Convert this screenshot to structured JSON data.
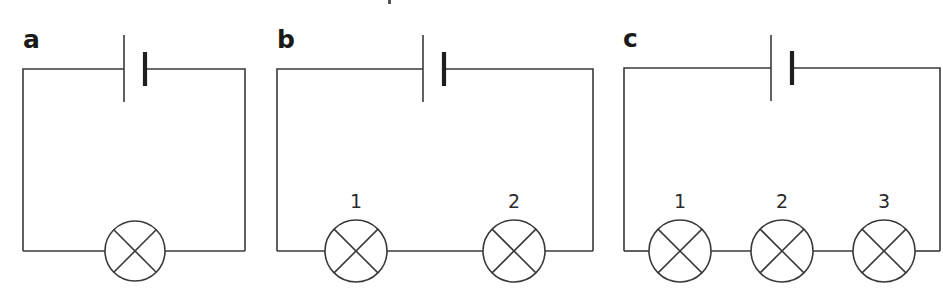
{
  "figure": {
    "colors": {
      "line": "#3a3a3a",
      "background": "#ffffff"
    }
  },
  "panels": [
    {
      "id": "a",
      "label": "a",
      "label_pos": [
        23,
        48
      ],
      "wire_box": {
        "left": 23,
        "right": 245,
        "top": 69,
        "bottom": 251
      },
      "battery": {
        "long_x": 124,
        "short_x": 145,
        "long_y": [
          35,
          102
        ],
        "short_y": [
          52,
          86
        ]
      },
      "lamps": [
        {
          "cx": 135,
          "cy": 251,
          "r": 30,
          "label": ""
        }
      ]
    },
    {
      "id": "b",
      "label": "b",
      "label_pos": [
        277,
        48
      ],
      "wire_box": {
        "left": 277,
        "right": 593,
        "top": 69,
        "bottom": 251
      },
      "battery": {
        "long_x": 423,
        "short_x": 444,
        "long_y": [
          35,
          102
        ],
        "short_y": [
          52,
          86
        ]
      },
      "lamps": [
        {
          "cx": 356,
          "cy": 251,
          "r": 31,
          "label": "1"
        },
        {
          "cx": 514,
          "cy": 251,
          "r": 31,
          "label": "2"
        }
      ]
    },
    {
      "id": "c",
      "label": "c",
      "label_pos": [
        623,
        47
      ],
      "wire_box": {
        "left": 624,
        "right": 940,
        "top": 68,
        "bottom": 251
      },
      "battery": {
        "long_x": 771,
        "short_x": 792,
        "long_y": [
          35,
          101
        ],
        "short_y": [
          51,
          85
        ]
      },
      "lamps": [
        {
          "cx": 680,
          "cy": 251,
          "r": 31,
          "label": "1"
        },
        {
          "cx": 782,
          "cy": 251,
          "r": 31,
          "label": "2"
        },
        {
          "cx": 884,
          "cy": 251,
          "r": 31,
          "label": "3"
        }
      ]
    }
  ],
  "lamp_label_offset_y": -43,
  "top_fragment": {
    "x": 388,
    "y": 0,
    "w": 3,
    "h": 4
  }
}
